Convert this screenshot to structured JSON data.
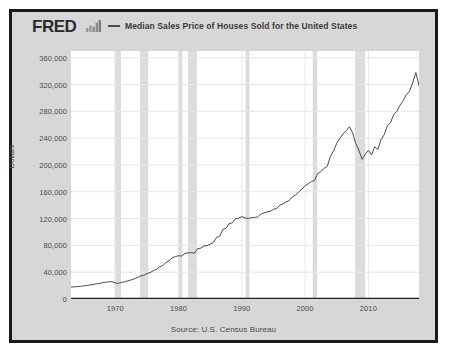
{
  "header": {
    "brand": "FRED",
    "brand_icon": "bar-chart-icon",
    "legend_marker": "line-swatch",
    "series_label": "Median Sales Price of Houses Sold for the United States"
  },
  "source": {
    "text": "Source: U.S. Census Bureau"
  },
  "colors": {
    "line": "#4b4b4b",
    "recession_band": "#dcdcdc",
    "plot_background": "#ffffff",
    "panel_background": "#d7d7d7",
    "frame": "#1a1a1a",
    "grid": "#e6e6e6",
    "axis": "#333333",
    "text": "#4a4a4a"
  },
  "chart_data": {
    "type": "line",
    "title": "Median Sales Price of Houses Sold for the United States",
    "xlabel": "",
    "ylabel": "Dollars",
    "xlim": [
      1963,
      2018
    ],
    "ylim": [
      0,
      370000
    ],
    "grid": true,
    "legend_position": "top",
    "ytick_labels": [
      "360,000",
      "320,000",
      "280,000",
      "240,000",
      "200,000",
      "160,000",
      "120,000",
      "80,000",
      "40,000",
      "0"
    ],
    "ytick_values": [
      360000,
      320000,
      280000,
      240000,
      200000,
      160000,
      120000,
      80000,
      40000,
      0
    ],
    "xtick_labels": [
      "1970",
      "1980",
      "1990",
      "2000",
      "2010"
    ],
    "xtick_values": [
      1970,
      1980,
      1990,
      2000,
      2010
    ],
    "series": [
      {
        "name": "Median Sales Price of Houses Sold for the United States",
        "color": "#4b4b4b",
        "x": [
          1963.0,
          1963.5,
          1964.0,
          1964.5,
          1965.0,
          1965.5,
          1966.0,
          1966.5,
          1967.0,
          1967.5,
          1968.0,
          1968.5,
          1969.0,
          1969.5,
          1970.0,
          1970.5,
          1971.0,
          1971.5,
          1972.0,
          1972.5,
          1973.0,
          1973.5,
          1974.0,
          1974.5,
          1975.0,
          1975.5,
          1976.0,
          1976.5,
          1977.0,
          1977.5,
          1978.0,
          1978.5,
          1979.0,
          1979.5,
          1980.0,
          1980.5,
          1981.0,
          1981.5,
          1982.0,
          1982.5,
          1983.0,
          1983.5,
          1984.0,
          1984.5,
          1985.0,
          1985.5,
          1986.0,
          1986.5,
          1987.0,
          1987.5,
          1988.0,
          1988.5,
          1989.0,
          1989.5,
          1990.0,
          1990.5,
          1991.0,
          1991.5,
          1992.0,
          1992.5,
          1993.0,
          1993.5,
          1994.0,
          1994.5,
          1995.0,
          1995.5,
          1996.0,
          1996.5,
          1997.0,
          1997.5,
          1998.0,
          1998.5,
          1999.0,
          1999.5,
          2000.0,
          2000.5,
          2001.0,
          2001.5,
          2002.0,
          2002.5,
          2003.0,
          2003.5,
          2004.0,
          2004.5,
          2005.0,
          2005.5,
          2006.0,
          2006.5,
          2007.0,
          2007.5,
          2008.0,
          2008.5,
          2009.0,
          2009.5,
          2010.0,
          2010.5,
          2011.0,
          2011.5,
          2012.0,
          2012.5,
          2013.0,
          2013.5,
          2014.0,
          2014.5,
          2015.0,
          2015.5,
          2016.0,
          2016.5,
          2017.0,
          2017.5,
          2018.0
        ],
        "y": [
          17800,
          18100,
          18500,
          18900,
          19600,
          20100,
          21000,
          21600,
          22700,
          23300,
          24400,
          25000,
          25600,
          25800,
          23900,
          23400,
          24800,
          25600,
          27100,
          28400,
          30100,
          32000,
          34500,
          35300,
          38100,
          39300,
          42300,
          44200,
          47900,
          50000,
          54300,
          57300,
          61500,
          63300,
          64600,
          64100,
          67800,
          68900,
          69100,
          68500,
          75100,
          75800,
          79200,
          79400,
          82000,
          84300,
          91800,
          93500,
          104000,
          105500,
          112500,
          113600,
          120000,
          120500,
          122900,
          121000,
          120000,
          121500,
          121500,
          122500,
          126500,
          128500,
          130000,
          131000,
          133900,
          135000,
          140000,
          142000,
          145000,
          147000,
          152500,
          155000,
          160000,
          164000,
          169000,
          172000,
          175200,
          177000,
          187600,
          190000,
          195000,
          198000,
          212700,
          221000,
          232500,
          240000,
          246500,
          251000,
          257000,
          248000,
          232100,
          222000,
          208400,
          216000,
          221800,
          215000,
          227200,
          223000,
          237900,
          245000,
          258400,
          263000,
          275200,
          280000,
          289200,
          296000,
          305000,
          310000,
          322500,
          337900,
          318600
        ]
      }
    ],
    "recession_bands": [
      {
        "start": 1969.9,
        "end": 1970.9
      },
      {
        "start": 1973.9,
        "end": 1975.2
      },
      {
        "start": 1980.0,
        "end": 1980.6
      },
      {
        "start": 1981.5,
        "end": 1982.9
      },
      {
        "start": 1990.6,
        "end": 1991.2
      },
      {
        "start": 2001.2,
        "end": 2001.9
      },
      {
        "start": 2007.9,
        "end": 2009.5
      }
    ]
  }
}
